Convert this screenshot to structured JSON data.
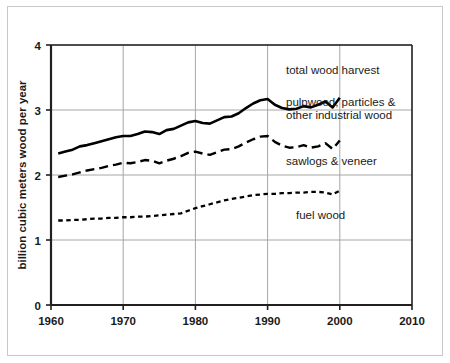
{
  "chart_data": {
    "type": "line",
    "title": "",
    "xlabel": "",
    "ylabel": "billion cubic meters wood per year",
    "xlim": [
      1960,
      2010
    ],
    "ylim": [
      0,
      4
    ],
    "xticks": [
      "1960",
      "1970",
      "1980",
      "1990",
      "2000",
      "2010"
    ],
    "yticks": [
      "0",
      "1",
      "2",
      "3",
      "4"
    ],
    "grid": true,
    "legend_position": "inline-annotations",
    "series": [
      {
        "name": "total wood harvest",
        "style": "solid",
        "color": "#000000",
        "x": [
          1961,
          1962,
          1963,
          1964,
          1965,
          1966,
          1967,
          1968,
          1969,
          1970,
          1971,
          1972,
          1973,
          1974,
          1975,
          1976,
          1977,
          1978,
          1979,
          1980,
          1981,
          1982,
          1983,
          1984,
          1985,
          1986,
          1987,
          1988,
          1989,
          1990,
          1991,
          1992,
          1993,
          1994,
          1995,
          1996,
          1997,
          1998,
          1999,
          2000
        ],
        "values": [
          2.33,
          2.36,
          2.39,
          2.44,
          2.46,
          2.49,
          2.52,
          2.55,
          2.58,
          2.6,
          2.6,
          2.63,
          2.67,
          2.66,
          2.63,
          2.69,
          2.71,
          2.76,
          2.81,
          2.83,
          2.8,
          2.79,
          2.84,
          2.89,
          2.9,
          2.95,
          3.03,
          3.1,
          3.15,
          3.17,
          3.08,
          3.03,
          3.01,
          3.02,
          3.06,
          3.04,
          3.08,
          3.13,
          3.04,
          3.19
        ],
        "values_unit": "billion cubic meters per year"
      },
      {
        "name": "sawlogs & veneer",
        "style": "dashed",
        "color": "#000000",
        "x": [
          1961,
          1962,
          1963,
          1964,
          1965,
          1966,
          1967,
          1968,
          1969,
          1970,
          1971,
          1972,
          1973,
          1974,
          1975,
          1976,
          1977,
          1978,
          1979,
          1980,
          1981,
          1982,
          1983,
          1984,
          1985,
          1986,
          1987,
          1988,
          1989,
          1990,
          1991,
          1992,
          1993,
          1994,
          1995,
          1996,
          1997,
          1998,
          1999,
          2000
        ],
        "values": [
          1.97,
          1.99,
          2.01,
          2.04,
          2.07,
          2.09,
          2.11,
          2.14,
          2.16,
          2.19,
          2.18,
          2.2,
          2.23,
          2.22,
          2.18,
          2.22,
          2.25,
          2.29,
          2.34,
          2.36,
          2.33,
          2.31,
          2.35,
          2.39,
          2.4,
          2.44,
          2.5,
          2.55,
          2.59,
          2.6,
          2.51,
          2.45,
          2.42,
          2.43,
          2.46,
          2.42,
          2.44,
          2.49,
          2.4,
          2.53
        ],
        "values_unit": "billion cubic meters per year"
      },
      {
        "name": "fuel wood",
        "style": "dotted",
        "color": "#000000",
        "x": [
          1961,
          1962,
          1963,
          1964,
          1965,
          1966,
          1967,
          1968,
          1969,
          1970,
          1971,
          1972,
          1973,
          1974,
          1975,
          1976,
          1977,
          1978,
          1979,
          1980,
          1981,
          1982,
          1983,
          1984,
          1985,
          1986,
          1987,
          1988,
          1989,
          1990,
          1991,
          1992,
          1993,
          1994,
          1995,
          1996,
          1997,
          1998,
          1999,
          2000
        ],
        "values": [
          1.3,
          1.3,
          1.31,
          1.31,
          1.32,
          1.33,
          1.33,
          1.34,
          1.34,
          1.35,
          1.35,
          1.36,
          1.36,
          1.37,
          1.38,
          1.39,
          1.4,
          1.41,
          1.45,
          1.49,
          1.52,
          1.55,
          1.58,
          1.61,
          1.63,
          1.65,
          1.67,
          1.69,
          1.7,
          1.71,
          1.71,
          1.72,
          1.72,
          1.73,
          1.73,
          1.74,
          1.74,
          1.73,
          1.7,
          1.76
        ],
        "values_unit": "billion cubic meters per year"
      }
    ],
    "annotations": [
      {
        "text": "total wood harvest",
        "x_px": 286,
        "y_px": 74,
        "anchor": "start"
      },
      {
        "text": "pulpwood, particles &",
        "x_px": 286,
        "y_px": 106,
        "anchor": "start"
      },
      {
        "text": "other industrial wood",
        "x_px": 286,
        "y_px": 119,
        "anchor": "start"
      },
      {
        "text": "sawlogs & veneer",
        "x_px": 286,
        "y_px": 165,
        "anchor": "start"
      },
      {
        "text": "fuel wood",
        "x_px": 296,
        "y_px": 219,
        "anchor": "start"
      }
    ]
  }
}
